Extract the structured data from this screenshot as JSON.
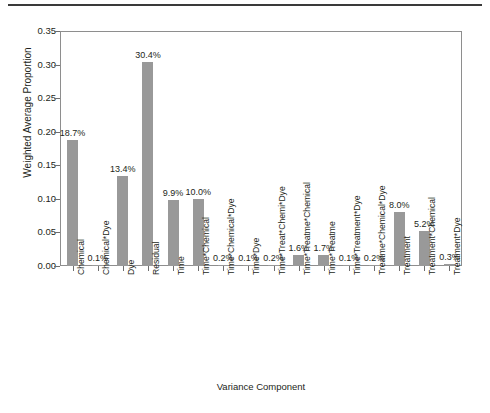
{
  "chart_data": {
    "type": "bar",
    "title": "",
    "xlabel": "Variance Component",
    "ylabel": "Weighted Average Proportion",
    "ylim": [
      0.0,
      0.35
    ],
    "ytick_labels": [
      "0.00",
      "0.05",
      "0.10",
      "0.15",
      "0.20",
      "0.25",
      "0.30",
      "0.35"
    ],
    "ytick_values": [
      0.0,
      0.05,
      0.1,
      0.15,
      0.2,
      0.25,
      0.3,
      0.35
    ],
    "grid": false,
    "legend": "none",
    "bar_color": "#999999",
    "axis_color": "#8e8e8e",
    "categories": [
      "Chemical",
      "Chemical*Dye",
      "Dye",
      "Residual",
      "Time",
      "Time*Chemical",
      "Time*Chemical*Dye",
      "Time*Dye",
      "Time*Treat*Chemi*Dye",
      "Time*Treatme*Chemical",
      "Time*Treatme",
      "Time*Treatment*Dye",
      "Treatme*Chemical*Dye",
      "Treatment",
      "Treatment*Chemical",
      "Treatment*Dye"
    ],
    "values": [
      0.187,
      0.001,
      0.134,
      0.304,
      0.099,
      0.1,
      0.002,
      0.001,
      0.002,
      0.016,
      0.017,
      0.001,
      0.002,
      0.08,
      0.052,
      0.003
    ],
    "data_labels": [
      "18.7%",
      "0.1%",
      "13.4%",
      "30.4%",
      "9.9%",
      "10.0%",
      "0.2%",
      "0.1%",
      "0.2%",
      "1.6%",
      "1.7%",
      "0.1%",
      "0.2%",
      "8.0%",
      "5.2%",
      "0.3%"
    ]
  }
}
